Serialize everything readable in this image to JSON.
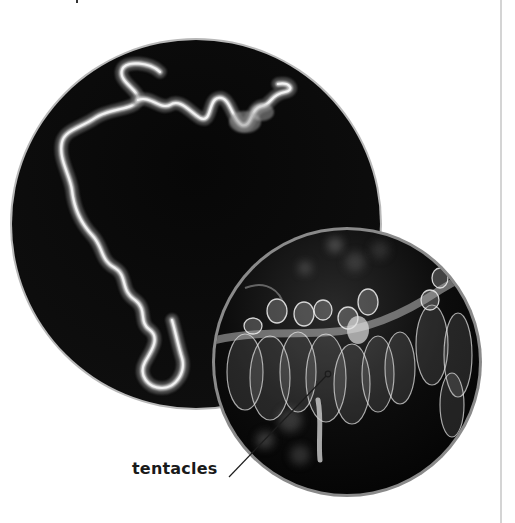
{
  "figure": {
    "large_photo": {
      "description": "siphonophore colony, long fuzzy white strand on black background",
      "ring_color": "#b8b8b8",
      "background_color": "#050505"
    },
    "inset_photo": {
      "description": "close-up of translucent siphonophore bells and tentacles",
      "ring_color": "#8a8a8a",
      "background_color": "#0a0a0a"
    },
    "callouts": [
      {
        "label": "tentacles"
      }
    ]
  },
  "layout": {
    "column_rule_color": "#d4d4d4"
  }
}
